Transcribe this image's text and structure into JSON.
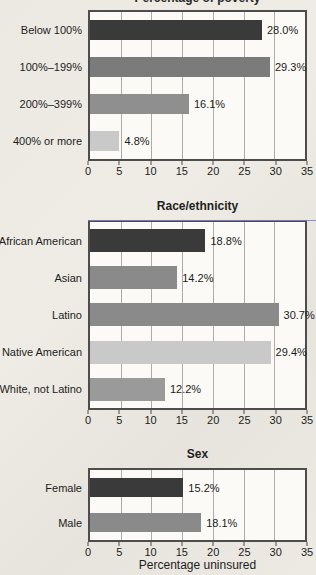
{
  "chart_data": {
    "type": "bar",
    "orientation": "horizontal",
    "xlabel": "Percentage uninsured",
    "xlim": [
      0,
      35
    ],
    "ticks": [
      0,
      5,
      10,
      15,
      20,
      25,
      30,
      35
    ],
    "grid": "vertical-gridlines-at-each-tick",
    "legend": "none",
    "colors": {
      "bar_dark": "#3a3a3a",
      "bar_medium": "#8a8a8a",
      "bar_light": "#c9c9c9",
      "frame": "#4d4d4d",
      "artifact_line": "#7c7ccd"
    },
    "charts": [
      {
        "title": "Percentage of poverty",
        "title_visibility": "clipped at top edge of screenshot",
        "categories": [
          "Below 100%",
          "100%–199%",
          "200%–399%",
          "400% or more"
        ],
        "values": [
          28.0,
          29.3,
          16.1,
          4.8
        ],
        "value_labels": [
          "28.0%",
          "29.3%",
          "16.1%",
          "4.8%"
        ],
        "bar_colors": [
          "#3a3a3a",
          "#7b7b7b",
          "#8f8f8f",
          "#c9c9c9"
        ]
      },
      {
        "title": "Race/ethnicity",
        "categories": [
          "African American",
          "Asian",
          "Latino",
          "Native American",
          "White, not Latino"
        ],
        "values": [
          18.8,
          14.2,
          30.7,
          29.4,
          12.2
        ],
        "value_labels": [
          "18.8%",
          "14.2%",
          "30.7%",
          "29.4%",
          "12.2%"
        ],
        "bar_colors": [
          "#3a3a3a",
          "#8a8a8a",
          "#8a8a8a",
          "#c9c9c9",
          "#9a9a9a"
        ]
      },
      {
        "title": "Sex",
        "categories": [
          "Female",
          "Male"
        ],
        "values": [
          15.2,
          18.1
        ],
        "value_labels": [
          "15.2%",
          "18.1%"
        ],
        "bar_colors": [
          "#3a3a3a",
          "#8a8a8a"
        ]
      }
    ]
  }
}
